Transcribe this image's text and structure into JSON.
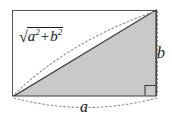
{
  "figure": {
    "type": "right-triangle-pythagorean-diagram",
    "title": "",
    "background_color": "#ffffff",
    "labels": {
      "hypotenuse": {
        "text": "√a² + b²",
        "radical_sign": "√",
        "base_a": "a",
        "exponent_a": "2",
        "operator": "+",
        "base_b": "b",
        "exponent_b": "2"
      },
      "vertical_leg": "b",
      "horizontal_leg": "a"
    },
    "colors": {
      "triangle_fill": "#c9c9c9",
      "triangle_stroke": "#3a3a3a",
      "frame_stroke": "#555555",
      "dotted_stroke": "#8c8c8c",
      "text": "#1a1a1a"
    },
    "geometry": {
      "frame": {
        "x": 12,
        "y": 10,
        "width": 145,
        "height": 86
      },
      "triangle_points": "14,96 156,96 156,10",
      "right_angle_marker": {
        "x": 145,
        "y": 85,
        "size": 10
      },
      "dotted_arc_hypotenuse": "M 15,94 Q 70,40 154,12",
      "dotted_line_vertical": "M 157,11 L 157,95",
      "dotted_arc_base": "M 14,99 Q 86,117 156,99"
    }
  }
}
